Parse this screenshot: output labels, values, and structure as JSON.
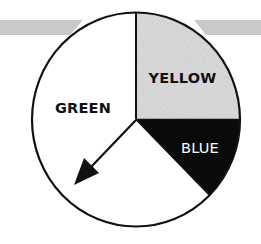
{
  "spinner": {
    "sections": [
      {
        "id": "green",
        "label": "GREEN",
        "fraction": 0.625,
        "fill": "#ffffff",
        "text_color": "#111111"
      },
      {
        "id": "yellow",
        "label": "YELLOW",
        "fraction": 0.25,
        "fill": "#d6d6d6",
        "text_color": "#111111"
      },
      {
        "id": "blue",
        "label": "BLUE",
        "fraction": 0.125,
        "fill": "#0a0a0a",
        "text_color": "#ffffff"
      }
    ],
    "pointer": {
      "direction": "lower-left",
      "points_to": "GREEN"
    }
  },
  "colors": {
    "outline": "#111111",
    "banner": "#c9c9c9",
    "yellow_texture": "#d6d6d6",
    "blue": "#0a0a0a"
  }
}
